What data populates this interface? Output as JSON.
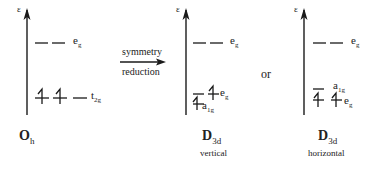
{
  "axis_label": "ε",
  "arrow": {
    "top_label": "symmetry",
    "bottom_label": "reduction"
  },
  "connector": "or",
  "panels": [
    {
      "symmetry": "O",
      "symmetry_sub": "h",
      "caption": "",
      "levels": [
        {
          "name": "e",
          "sub": "g",
          "electrons": 0,
          "degeneracy": 2
        },
        {
          "name": "t",
          "sub": "2g",
          "electrons": 2,
          "degeneracy": 3
        }
      ]
    },
    {
      "symmetry": "D",
      "symmetry_sub": "3d",
      "caption": "vertical",
      "levels": [
        {
          "name": "e",
          "sub": "g",
          "electrons": 0,
          "degeneracy": 2
        },
        {
          "name": "e",
          "sub": "g",
          "electrons": 1,
          "degeneracy": 2
        },
        {
          "name": "a",
          "sub": "1g",
          "electrons": 1,
          "degeneracy": 1
        }
      ]
    },
    {
      "symmetry": "D",
      "symmetry_sub": "3d",
      "caption": "horizontal",
      "levels": [
        {
          "name": "e",
          "sub": "g",
          "electrons": 0,
          "degeneracy": 2
        },
        {
          "name": "a",
          "sub": "1g",
          "electrons": 0,
          "degeneracy": 1
        },
        {
          "name": "e",
          "sub": "g",
          "electrons": 2,
          "degeneracy": 2
        }
      ]
    }
  ],
  "colors": {
    "line": "#1a1a1a",
    "text": "#222222"
  }
}
